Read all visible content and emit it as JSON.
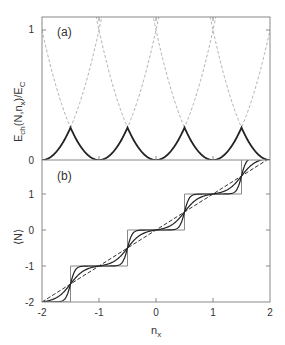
{
  "chart_data": [
    {
      "panel": "(a)",
      "type": "line",
      "title": "",
      "xlabel": "n_x",
      "ylabel": "E_ch(N,n_x)/E_C",
      "xlim": [
        -2,
        2
      ],
      "ylim": [
        0,
        1.1
      ],
      "yticks": [
        "0",
        "1"
      ],
      "series": [
        {
          "name": "parabolas E_ch(N,n_x)=(N-n_x)^2 for N=-2..2",
          "style": "dashed-gray",
          "N": [
            -2,
            -1,
            0,
            1,
            2
          ]
        },
        {
          "name": "ground-state energy (lower envelope)",
          "style": "solid-black",
          "x": [
            -2,
            -1.5,
            -1,
            -0.5,
            0,
            0.5,
            1,
            1.5,
            2
          ],
          "values": [
            0,
            0.25,
            0,
            0.25,
            0,
            0.25,
            0,
            0.25,
            0
          ]
        }
      ]
    },
    {
      "panel": "(b)",
      "type": "line",
      "xlabel": "n_x",
      "ylabel": "⟨N⟩",
      "xlim": [
        -2,
        2
      ],
      "ylim": [
        -2,
        2
      ],
      "xticks": [
        "-2",
        "-1",
        "0",
        "1",
        "2"
      ],
      "yticks": [
        "-2",
        "-1",
        "0",
        "1"
      ],
      "series": [
        {
          "name": "T=0 staircase",
          "style": "thin-gray",
          "steps_at": [
            -1.5,
            -0.5,
            0.5,
            1.5
          ]
        },
        {
          "name": "low temperature",
          "style": "solid-black",
          "beta": 12
        },
        {
          "name": "intermediate temperature",
          "style": "solid-black",
          "beta": 4
        },
        {
          "name": "high temperature (linear)",
          "style": "dashed-black",
          "values_at_x": {
            "-2": -2,
            "2": 2
          }
        }
      ]
    }
  ],
  "labels": {
    "panel_a": "(a)",
    "panel_b": "(b)",
    "ylabel_a_main": "E",
    "ylabel_a_sub1": "ch",
    "ylabel_a_mid": "(N,n",
    "ylabel_a_sub2": "x",
    "ylabel_a_end": ")/E",
    "ylabel_a_sub3": "C",
    "ylabel_b": "⟨N⟩",
    "xlabel_main": "n",
    "xlabel_sub": "x",
    "ya_ticks": [
      "0",
      "1"
    ],
    "yb_ticks": [
      "-2",
      "-1",
      "0",
      "1"
    ],
    "x_ticks": [
      "-2",
      "-1",
      "0",
      "1",
      "2"
    ]
  }
}
